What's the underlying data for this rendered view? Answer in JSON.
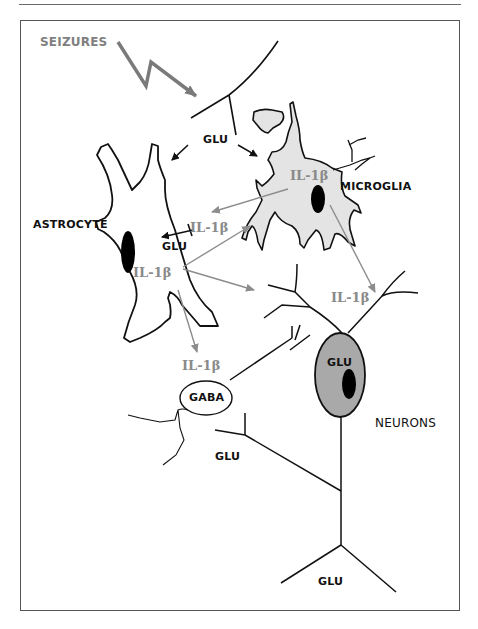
{
  "diagram": {
    "type": "cell-signaling-schematic",
    "labels": {
      "seizures": "SEIZURES",
      "microglia": "MICROGLIA",
      "astrocyte": "ASTROCYTE",
      "neurons": "NEURONS",
      "gaba": "GABA",
      "glu_top": "GLU",
      "glu_astrocyte": "GLU",
      "glu_neuron_soma": "GLU",
      "glu_lower_left": "GLU",
      "glu_bottom": "GLU",
      "il1b_microglia": "IL-1β",
      "il1b_between": "IL-1β",
      "il1b_astrocyte": "IL-1β",
      "il1b_neuron": "IL-1β",
      "il1b_gaba": "IL-1β"
    },
    "nodes": [
      {
        "id": "seizures",
        "label": "SEIZURES"
      },
      {
        "id": "microglia",
        "label": "MICROGLIA"
      },
      {
        "id": "astrocyte",
        "label": "ASTROCYTE"
      },
      {
        "id": "neuron",
        "label": "NEURONS"
      },
      {
        "id": "gaba-interneuron",
        "label": "GABA"
      }
    ],
    "edges": [
      {
        "from": "seizures",
        "to": "presynaptic-terminal",
        "label": ""
      },
      {
        "from": "presynaptic-terminal",
        "to": "astrocyte",
        "label": "GLU"
      },
      {
        "from": "presynaptic-terminal",
        "to": "microglia",
        "label": "GLU"
      },
      {
        "from": "microglia",
        "to": "astrocyte",
        "label": "IL-1β"
      },
      {
        "from": "astrocyte",
        "to": "microglia",
        "label": "IL-1β"
      },
      {
        "from": "astrocyte",
        "to": "neuron",
        "label": "IL-1β"
      },
      {
        "from": "astrocyte",
        "to": "gaba-interneuron",
        "label": "IL-1β"
      },
      {
        "from": "microglia",
        "to": "neuron",
        "label": "IL-1β"
      }
    ],
    "colors": {
      "outline": "#111111",
      "microglia_fill": "#e4e4e4",
      "neuron_fill": "#a9a9a9",
      "nucleus": "#000000",
      "il1b_arrow": "#8c8c8c",
      "seizure_arrow": "#7a7a7a",
      "frame": "#555555"
    }
  }
}
